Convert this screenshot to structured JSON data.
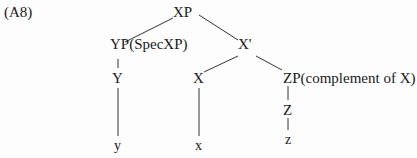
{
  "example_label": "(A8)",
  "tree": {
    "root": "XP",
    "spec": "YP(SpecXP)",
    "bar": "X'",
    "spec_head": "Y",
    "head": "X",
    "complement": "ZP(complement of X)",
    "comp_head": "Z",
    "spec_terminal": "y",
    "head_terminal": "x",
    "comp_terminal": "z"
  },
  "edges": [
    [
      "root",
      "spec"
    ],
    [
      "root",
      "bar"
    ],
    [
      "spec",
      "spec_head"
    ],
    [
      "spec_head",
      "spec_terminal"
    ],
    [
      "bar",
      "head"
    ],
    [
      "bar",
      "complement"
    ],
    [
      "head",
      "head_terminal"
    ],
    [
      "complement",
      "comp_head"
    ],
    [
      "comp_head",
      "comp_terminal"
    ]
  ],
  "colors": {
    "ink": "#1a1a1a"
  }
}
